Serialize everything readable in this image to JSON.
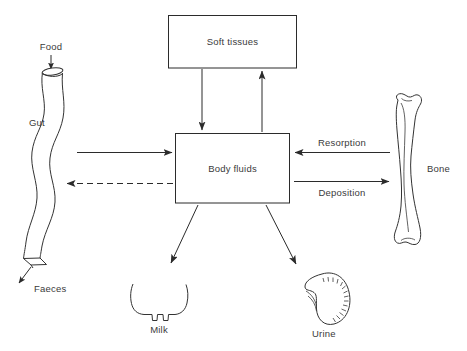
{
  "diagram": {
    "background_color": "#ffffff",
    "line_color": "#2b2b2b",
    "text_color": "#3a3a3a",
    "boxes": [
      {
        "id": "soft-tissues",
        "label": "Soft tissues"
      },
      {
        "id": "body-fluids",
        "label": "Body fluids"
      }
    ],
    "organs": [
      {
        "id": "gut",
        "label": "Gut"
      },
      {
        "id": "bone",
        "label": "Bone"
      },
      {
        "id": "udder",
        "label": "Milk"
      },
      {
        "id": "kidney",
        "label": "Urine"
      }
    ],
    "flow_labels": [
      {
        "id": "food",
        "label": "Food"
      },
      {
        "id": "faeces",
        "label": "Faeces"
      },
      {
        "id": "resorption",
        "label": "Resorption"
      },
      {
        "id": "deposition",
        "label": "Deposition"
      }
    ],
    "arrows": [
      {
        "id": "food-in",
        "from": "Food",
        "to": "Gut",
        "style": "solid",
        "direction": "down"
      },
      {
        "id": "gut-to-fluids",
        "from": "Gut",
        "to": "Body fluids",
        "style": "solid",
        "direction": "right"
      },
      {
        "id": "fluids-to-gut",
        "from": "Body fluids",
        "to": "Gut",
        "style": "dashed",
        "direction": "left"
      },
      {
        "id": "gut-to-faeces",
        "from": "Gut",
        "to": "Faeces",
        "style": "solid",
        "direction": "down-left"
      },
      {
        "id": "fluids-to-soft",
        "from": "Body fluids",
        "to": "Soft tissues",
        "style": "solid",
        "direction": "up"
      },
      {
        "id": "soft-to-fluids",
        "from": "Soft tissues",
        "to": "Body fluids",
        "style": "solid",
        "direction": "down"
      },
      {
        "id": "bone-resorption",
        "from": "Bone",
        "to": "Body fluids",
        "style": "solid",
        "direction": "left",
        "label": "Resorption"
      },
      {
        "id": "bone-deposition",
        "from": "Body fluids",
        "to": "Bone",
        "style": "solid",
        "direction": "right",
        "label": "Deposition"
      },
      {
        "id": "fluids-to-milk",
        "from": "Body fluids",
        "to": "Milk",
        "style": "solid",
        "direction": "down-left"
      },
      {
        "id": "fluids-to-urine",
        "from": "Body fluids",
        "to": "Urine",
        "style": "solid",
        "direction": "down-right"
      }
    ]
  }
}
